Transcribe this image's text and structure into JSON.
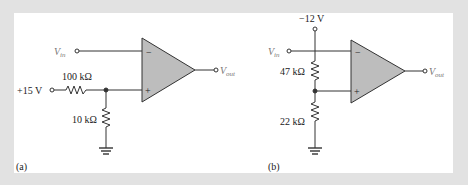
{
  "figure": {
    "panels": [
      {
        "id": "a",
        "caption": "(a)",
        "input_label": "V",
        "input_sub": "in",
        "output_label": "V",
        "output_sub": "out",
        "supply": "+15 V",
        "r_top": "100 kΩ",
        "r_bottom": "10 kΩ",
        "inverting_sign": "−",
        "noninverting_sign": "+"
      },
      {
        "id": "b",
        "caption": "(b)",
        "input_label": "V",
        "input_sub": "in",
        "output_label": "V",
        "output_sub": "out",
        "supply": "−12 V",
        "r_top": "47 kΩ",
        "r_bottom": "22 kΩ",
        "inverting_sign": "−",
        "noninverting_sign": "+"
      }
    ],
    "colors": {
      "background": "#e2e2e2",
      "panel": "#ffffff",
      "opamp_fill": "#bdbdbd",
      "wire": "#333333"
    }
  }
}
